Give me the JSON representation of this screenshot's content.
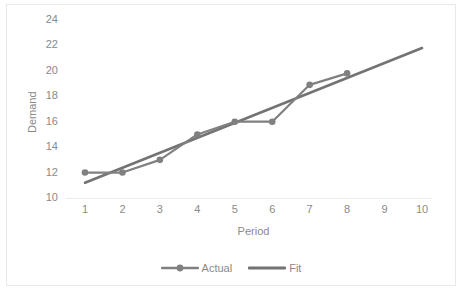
{
  "chart_data": {
    "type": "line",
    "title": "",
    "xlabel": "Period",
    "ylabel": "Demand",
    "x": [
      1,
      2,
      3,
      4,
      5,
      6,
      7,
      8,
      9,
      10
    ],
    "xlim": [
      1,
      10
    ],
    "ylim": [
      10,
      24
    ],
    "ytick_labels": [
      "10",
      "12",
      "14",
      "16",
      "18",
      "20",
      "22",
      "24"
    ],
    "ytick_values": [
      10,
      12,
      14,
      16,
      18,
      20,
      22,
      24
    ],
    "xtick_labels": [
      "1",
      "2",
      "3",
      "4",
      "5",
      "6",
      "7",
      "8",
      "9",
      "10"
    ],
    "grid": false,
    "legend_position": "bottom",
    "series": [
      {
        "name": "Actual",
        "marker": "circle",
        "color": "#808080",
        "x": [
          1,
          2,
          3,
          4,
          5,
          6,
          7,
          8
        ],
        "values": [
          12,
          12,
          13,
          15,
          16,
          16,
          18.9,
          19.8
        ]
      },
      {
        "name": "Fit",
        "marker": "none",
        "color": "#737373",
        "x": [
          1,
          10
        ],
        "values": [
          11.2,
          21.8
        ]
      }
    ]
  },
  "axis": {
    "ylabel": "Demand",
    "xlabel": "Period"
  },
  "legend": {
    "items": [
      {
        "label": "Actual"
      },
      {
        "label": "Fit"
      }
    ]
  },
  "colors": {
    "series_actual": "#808080",
    "series_fit": "#737373",
    "axis_line": "#ededed",
    "tick_text": "#8a8a8a",
    "frame_border": "#e9e9e9",
    "background": "#ffffff"
  }
}
